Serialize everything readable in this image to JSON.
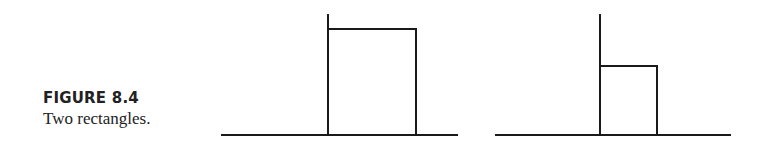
{
  "caption": {
    "label": "FIGURE 8.4",
    "text": "Two rectangles."
  },
  "colors": {
    "stroke": "#1a1a1a",
    "text": "#222222",
    "background": "#ffffff"
  },
  "diagrams": [
    {
      "name": "left-rectangle-diagram",
      "baseline": {
        "x1": 221,
        "x2": 458,
        "y": 135
      },
      "axis": {
        "x": 328,
        "y_top": 14
      },
      "rectangle": {
        "x": 328,
        "y": 29,
        "width": 88,
        "height": 106
      }
    },
    {
      "name": "right-rectangle-diagram",
      "baseline": {
        "x1": 495,
        "x2": 731,
        "y": 135
      },
      "axis": {
        "x": 600,
        "y_top": 14
      },
      "rectangle": {
        "x": 600,
        "y": 66,
        "width": 57,
        "height": 69
      }
    }
  ]
}
